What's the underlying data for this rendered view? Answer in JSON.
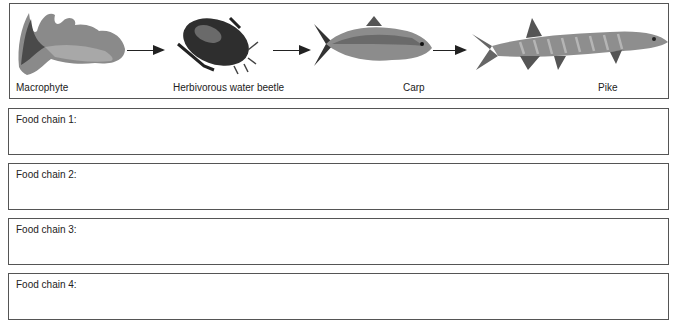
{
  "food_web": {
    "organisms": [
      {
        "label": "Macrophyte",
        "icon": "macrophyte-plant-icon"
      },
      {
        "label": "Herbivorous water beetle",
        "icon": "water-beetle-icon"
      },
      {
        "label": "Carp",
        "icon": "carp-fish-icon"
      },
      {
        "label": "Pike",
        "icon": "pike-fish-icon"
      }
    ]
  },
  "answer_boxes": [
    {
      "label": "Food chain 1:",
      "value": ""
    },
    {
      "label": "Food chain 2:",
      "value": ""
    },
    {
      "label": "Food chain 3:",
      "value": ""
    },
    {
      "label": "Food chain 4:",
      "value": ""
    }
  ]
}
